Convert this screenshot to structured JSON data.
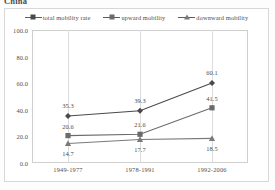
{
  "title": "China",
  "legend": {
    "items": [
      {
        "label": "total mobility rate",
        "marker": "diamond-marker-icon"
      },
      {
        "label": "upward mobility",
        "marker": "square-marker-icon"
      },
      {
        "label": "downward mobility",
        "marker": "triangle-marker-icon"
      }
    ]
  },
  "axes": {
    "y_ticks": [
      "100.0",
      "80.0",
      "60.0",
      "40.0",
      "20.0",
      "0.0"
    ],
    "x_ticks": [
      "1949-1977",
      "1978-1991",
      "1992-2006"
    ]
  },
  "labels": {
    "total": [
      "35.3",
      "39.3",
      "60.1"
    ],
    "upward": [
      "20.6",
      "21.6",
      "41.5"
    ],
    "downward": [
      "14.7",
      "17.7",
      "18.5"
    ]
  },
  "colors": {
    "total": "#4a4a4a",
    "upward": "#6b6b6b",
    "downward": "#7a7a7a",
    "grid": "#dcdcdc",
    "frame": "#cfcfcf",
    "text": "#4f4f4f"
  },
  "chart_data": {
    "type": "line",
    "title": "China",
    "xlabel": "",
    "ylabel": "",
    "categories": [
      "1949-1977",
      "1978-1991",
      "1992-2006"
    ],
    "series": [
      {
        "name": "total mobility rate",
        "values": [
          35.3,
          39.3,
          60.1
        ],
        "marker": "diamond"
      },
      {
        "name": "upward mobility",
        "values": [
          20.6,
          21.6,
          41.5
        ],
        "marker": "square"
      },
      {
        "name": "downward mobility",
        "values": [
          14.7,
          17.7,
          18.5
        ],
        "marker": "triangle"
      }
    ],
    "ylim": [
      0,
      100
    ],
    "yticks": [
      0,
      20,
      40,
      60,
      80,
      100
    ],
    "grid": "vertical-only",
    "legend_position": "top",
    "data_labels": true
  }
}
